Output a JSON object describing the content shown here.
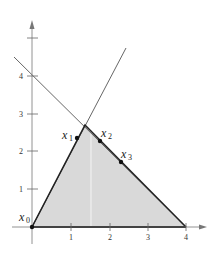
{
  "colors": {
    "axis": "#555555",
    "region_fill": "#d9d9d9",
    "region_edge": "#222222",
    "thin_line": "#555555",
    "point": "#111111",
    "faint_vertical": "#f2f2f2"
  },
  "axes": {
    "x_ticks": [
      "1",
      "2",
      "3",
      "4"
    ],
    "y_ticks": [
      "1",
      "2",
      "3",
      "4"
    ]
  },
  "points": [
    {
      "name": "x",
      "sub": "0"
    },
    {
      "name": "x",
      "sub": "1"
    },
    {
      "name": "x",
      "sub": "2"
    },
    {
      "name": "x",
      "sub": "3"
    }
  ]
}
